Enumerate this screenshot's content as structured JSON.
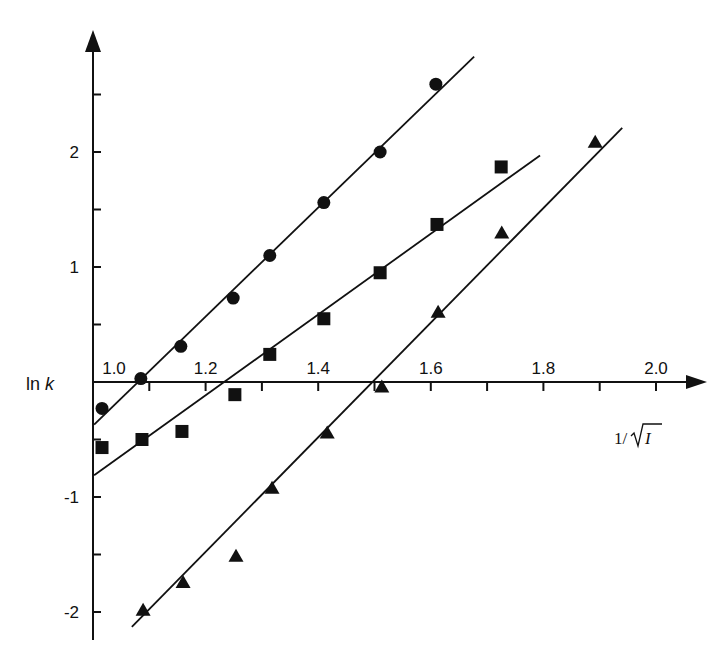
{
  "chart_data": {
    "type": "scatter",
    "title": "",
    "xlabel": "1/√I",
    "ylabel": "ln k",
    "xlim": [
      1.0,
      2.0
    ],
    "ylim": [
      -2.2,
      3.0
    ],
    "x_ticks": [
      1.0,
      1.1,
      1.2,
      1.3,
      1.4,
      1.5,
      1.6,
      1.7,
      1.8,
      1.9,
      2.0
    ],
    "x_tick_labels": [
      "1.0",
      "1.2",
      "1.4",
      "1.6",
      "1.8",
      "2.0"
    ],
    "x_tick_label_values": [
      1.0,
      1.2,
      1.4,
      1.6,
      1.8,
      2.0
    ],
    "y_ticks": [
      -2.0,
      -1.5,
      -1.0,
      -0.5,
      0.5,
      1.0,
      1.5,
      2.0,
      2.5
    ],
    "y_tick_labels": [
      "-2",
      "-1",
      "1",
      "2"
    ],
    "y_tick_label_values": [
      -2,
      -1,
      1,
      2
    ],
    "grid": false,
    "legend": null,
    "series": [
      {
        "name": "circles",
        "marker": "circle",
        "color": "#111111",
        "x": [
          1.016,
          1.085,
          1.156,
          1.249,
          1.314,
          1.41,
          1.51,
          1.609
        ],
        "y": [
          -0.23,
          0.03,
          0.31,
          0.73,
          1.1,
          1.56,
          2.0,
          2.59
        ],
        "fit_line": {
          "x": [
            1.002,
            1.677
          ],
          "y": [
            -0.37,
            2.83
          ]
        }
      },
      {
        "name": "squares",
        "marker": "square",
        "color": "#111111",
        "x": [
          1.016,
          1.087,
          1.158,
          1.252,
          1.314,
          1.41,
          1.51,
          1.611,
          1.725
        ],
        "y": [
          -0.57,
          -0.5,
          -0.43,
          -0.11,
          0.24,
          0.55,
          0.95,
          1.37,
          1.87
        ],
        "fit_line": {
          "x": [
            1.002,
            1.794
          ],
          "y": [
            -0.81,
            1.97
          ]
        }
      },
      {
        "name": "triangles",
        "marker": "triangle",
        "color": "#111111",
        "x": [
          1.089,
          1.16,
          1.254,
          1.318,
          1.416,
          1.513,
          1.613,
          1.726,
          1.892
        ],
        "y": [
          -1.98,
          -1.74,
          -1.51,
          -0.92,
          -0.44,
          -0.04,
          0.61,
          1.3,
          2.09
        ],
        "fit_line": {
          "x": [
            1.069,
            1.94
          ],
          "y": [
            -2.13,
            2.21
          ]
        }
      }
    ]
  },
  "labels": {
    "ylabel": "ln ",
    "ylabel_italic": "k",
    "xlabel_prefix": "1/",
    "xlabel_radicand": "I"
  }
}
